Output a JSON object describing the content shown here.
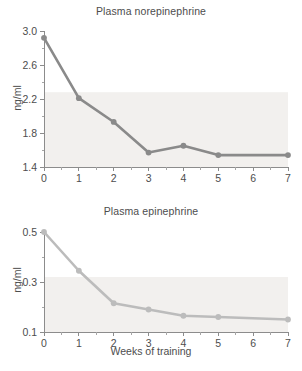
{
  "figure": {
    "background_color": "#ffffff",
    "text_color": "#4d4d4d",
    "axis_color": "#8c8c8c"
  },
  "xlabel": "Weeks of training",
  "charts": [
    {
      "key": "norepinephrine",
      "title": "Plasma norepinephrine",
      "ylabel": "ng/ml",
      "series_color": "#8a8a8a",
      "y_ticklabels": [
        "3.0",
        "2.6",
        "2.2",
        "1.8",
        "1.4"
      ],
      "x_ticklabels": [
        "0",
        "1",
        "2",
        "3",
        "4",
        "5",
        "6",
        "7"
      ]
    },
    {
      "key": "epinephrine",
      "title": "Plasma epinephrine",
      "ylabel": "ng/ml",
      "series_color": "#bcbcbc",
      "y_ticklabels": [
        "0.5",
        "0.3",
        "0.1"
      ],
      "x_ticklabels": [
        "0",
        "1",
        "2",
        "3",
        "4",
        "5",
        "6",
        "7"
      ]
    }
  ],
  "chart_data": [
    {
      "type": "line",
      "title": "Plasma norepinephrine",
      "xlabel": "Weeks of training",
      "ylabel": "ng/ml",
      "x": [
        0,
        1,
        2,
        3,
        4,
        5,
        7
      ],
      "values": [
        2.92,
        2.21,
        1.93,
        1.57,
        1.65,
        1.54,
        1.54
      ],
      "xlim": [
        0,
        7
      ],
      "ylim": [
        1.4,
        3.0
      ],
      "y_major_ticks": [
        1.4,
        1.8,
        2.2,
        2.6,
        3.0
      ],
      "y_minor_ticks": [
        1.6,
        2.0,
        2.4,
        2.8
      ],
      "x_ticks": [
        0,
        1,
        2,
        3,
        4,
        5,
        6,
        7
      ],
      "grid": false,
      "legend": "none",
      "marker": "circle",
      "color": "#8a8a8a"
    },
    {
      "type": "line",
      "title": "Plasma epinephrine",
      "xlabel": "Weeks of training",
      "ylabel": "ng/ml",
      "x": [
        0,
        1,
        2,
        3,
        4,
        5,
        7
      ],
      "values": [
        0.5,
        0.345,
        0.215,
        0.19,
        0.165,
        0.16,
        0.15
      ],
      "xlim": [
        0,
        7
      ],
      "ylim": [
        0.1,
        0.5
      ],
      "y_major_ticks": [
        0.1,
        0.3,
        0.5
      ],
      "y_minor_ticks": [
        0.2,
        0.4
      ],
      "x_ticks": [
        0,
        1,
        2,
        3,
        4,
        5,
        6,
        7
      ],
      "grid": false,
      "legend": "none",
      "marker": "circle",
      "color": "#bcbcbc"
    }
  ]
}
